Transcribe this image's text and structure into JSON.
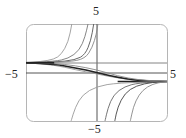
{
  "chart_data": {
    "type": "line",
    "title": "",
    "xlabel": "",
    "ylabel": "",
    "xlim": [
      -5,
      5
    ],
    "ylim": [
      -3.5,
      3.5
    ],
    "grid": false,
    "legend": null,
    "tick_labels": {
      "x_left": "−5",
      "x_right": "5",
      "y_top": "5",
      "y_bottom": "−5"
    },
    "horizontal_lines": [
      {
        "y": 0.7,
        "description": "upper horizontal asymptote / line"
      },
      {
        "y": -0.65,
        "description": "lower horizontal asymptote (right side)"
      }
    ],
    "series": [
      {
        "name": "blowup-up-1",
        "color": "#9a9a9a",
        "points": [
          [
            -5,
            0.72
          ],
          [
            -4,
            0.78
          ],
          [
            -3,
            0.95
          ],
          [
            -2.5,
            1.3
          ],
          [
            -2.0,
            2.2
          ],
          [
            -1.75,
            3.5
          ]
        ]
      },
      {
        "name": "blowup-up-2",
        "color": "#777777",
        "points": [
          [
            -5,
            0.71
          ],
          [
            -3,
            0.8
          ],
          [
            -2,
            1.0
          ],
          [
            -1.2,
            1.6
          ],
          [
            -0.8,
            2.6
          ],
          [
            -0.6,
            3.5
          ]
        ]
      },
      {
        "name": "blowup-up-3",
        "color": "#555555",
        "points": [
          [
            -5,
            0.7
          ],
          [
            -3,
            0.75
          ],
          [
            -1.5,
            0.9
          ],
          [
            -0.8,
            1.3
          ],
          [
            -0.4,
            2.3
          ],
          [
            -0.2,
            3.5
          ]
        ]
      },
      {
        "name": "blowup-up-4",
        "color": "#888888",
        "points": [
          [
            -5,
            0.7
          ],
          [
            -2,
            0.75
          ],
          [
            -0.8,
            1.0
          ],
          [
            -0.3,
            1.8
          ],
          [
            0.0,
            2.8
          ],
          [
            0.1,
            3.5
          ]
        ]
      },
      {
        "name": "s-curve-1",
        "color": "#9a9a9a",
        "points": [
          [
            -5,
            0.7
          ],
          [
            -3,
            0.55
          ],
          [
            -1.5,
            0.2
          ],
          [
            0,
            -0.1
          ],
          [
            1.5,
            -0.4
          ],
          [
            3,
            -0.6
          ],
          [
            5,
            -0.65
          ]
        ]
      },
      {
        "name": "s-curve-2",
        "color": "#222222",
        "points": [
          [
            -5,
            0.7
          ],
          [
            -3,
            0.6
          ],
          [
            -1.5,
            0.35
          ],
          [
            0,
            0.0
          ],
          [
            1.5,
            -0.35
          ],
          [
            3,
            -0.6
          ],
          [
            5,
            -0.65
          ]
        ]
      },
      {
        "name": "s-curve-3",
        "color": "#888888",
        "points": [
          [
            -5,
            0.7
          ],
          [
            -3,
            0.65
          ],
          [
            -1.5,
            0.5
          ],
          [
            0,
            0.2
          ],
          [
            1.5,
            -0.25
          ],
          [
            3,
            -0.55
          ],
          [
            5,
            -0.65
          ]
        ]
      },
      {
        "name": "blowdown-1",
        "color": "#9a9a9a",
        "points": [
          [
            -1.8,
            -3.5
          ],
          [
            -1.5,
            -2.5
          ],
          [
            -1,
            -1.6
          ],
          [
            0,
            -1.0
          ],
          [
            1.5,
            -0.75
          ],
          [
            5,
            -0.65
          ]
        ]
      },
      {
        "name": "blowdown-2",
        "color": "#666666",
        "points": [
          [
            0.6,
            -3.5
          ],
          [
            0.8,
            -2.6
          ],
          [
            1.2,
            -1.6
          ],
          [
            2,
            -1.0
          ],
          [
            3,
            -0.75
          ],
          [
            5,
            -0.65
          ]
        ]
      },
      {
        "name": "blowdown-3",
        "color": "#444444",
        "points": [
          [
            1.3,
            -3.5
          ],
          [
            1.5,
            -2.5
          ],
          [
            2,
            -1.5
          ],
          [
            2.8,
            -0.95
          ],
          [
            4,
            -0.7
          ],
          [
            5,
            -0.65
          ]
        ]
      },
      {
        "name": "blowdown-4",
        "color": "#888888",
        "points": [
          [
            2.4,
            -3.5
          ],
          [
            2.6,
            -2.5
          ],
          [
            3,
            -1.6
          ],
          [
            3.6,
            -1.0
          ],
          [
            4.4,
            -0.72
          ],
          [
            5,
            -0.66
          ]
        ]
      }
    ]
  },
  "labels": {
    "x_left": "−5",
    "x_right": "5",
    "y_top": "5",
    "y_bottom": "−5"
  }
}
